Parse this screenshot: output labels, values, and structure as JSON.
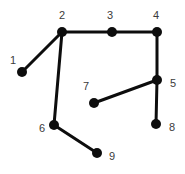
{
  "figure": {
    "kind": "node-link-diagram",
    "background_color": "#ffffff",
    "node_color": "#0d0d0d",
    "edge_color": "#0d0d0d",
    "label_color": "#3b3b3b",
    "node_radius": 5,
    "edge_width": 3,
    "width": 185,
    "height": 174
  },
  "nodes": [
    {
      "id": "1",
      "label": "1",
      "cx": 22,
      "cy": 72,
      "label_x": 13,
      "label_y": 60
    },
    {
      "id": "2",
      "label": "2",
      "cx": 62,
      "cy": 32,
      "label_x": 62,
      "label_y": 15
    },
    {
      "id": "3",
      "label": "3",
      "cx": 112,
      "cy": 32,
      "label_x": 110,
      "label_y": 15
    },
    {
      "id": "4",
      "label": "4",
      "cx": 157,
      "cy": 32,
      "label_x": 156,
      "label_y": 15
    },
    {
      "id": "5",
      "label": "5",
      "cx": 157,
      "cy": 80,
      "label_x": 173,
      "label_y": 83
    },
    {
      "id": "6",
      "label": "6",
      "cx": 54,
      "cy": 125,
      "label_x": 42,
      "label_y": 128
    },
    {
      "id": "7",
      "label": "7",
      "cx": 94,
      "cy": 103,
      "label_x": 86,
      "label_y": 86
    },
    {
      "id": "8",
      "label": "8",
      "cx": 156,
      "cy": 124,
      "label_x": 172,
      "label_y": 127
    },
    {
      "id": "9",
      "label": "9",
      "cx": 97,
      "cy": 153,
      "label_x": 112,
      "label_y": 156
    }
  ],
  "edges": [
    {
      "from": "1",
      "to": "2"
    },
    {
      "from": "2",
      "to": "3"
    },
    {
      "from": "3",
      "to": "4"
    },
    {
      "from": "2",
      "to": "6"
    },
    {
      "from": "4",
      "to": "5"
    },
    {
      "from": "5",
      "to": "8"
    },
    {
      "from": "5",
      "to": "7"
    },
    {
      "from": "6",
      "to": "9"
    }
  ]
}
